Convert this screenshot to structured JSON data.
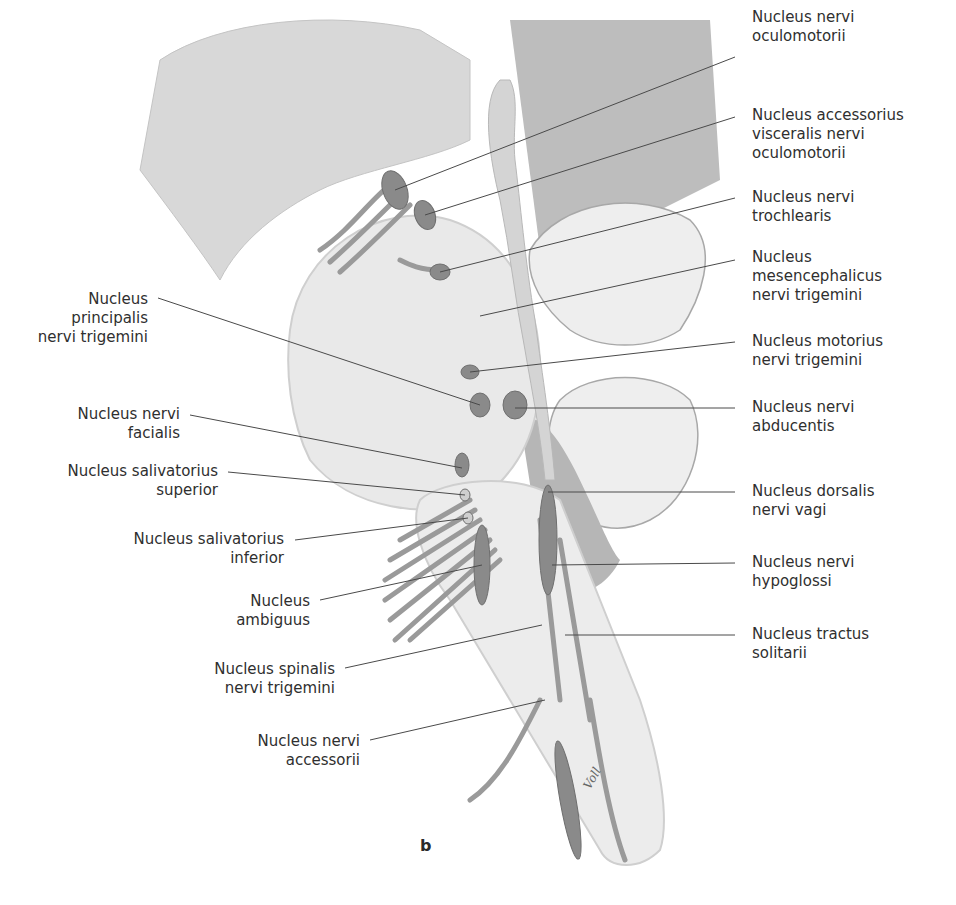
{
  "figure": {
    "panel_letter": "b",
    "signature": "Voll"
  },
  "labels_right": [
    {
      "text": "Nucleus nervi\noculomotorii"
    },
    {
      "text": "Nucleus accessorius\nvisceralis nervi\noculomotorii"
    },
    {
      "text": "Nucleus nervi\ntrochlearis"
    },
    {
      "text": "Nucleus\nmesencephalicus\nnervi trigemini"
    },
    {
      "text": "Nucleus motorius\nnervi trigemini"
    },
    {
      "text": "Nucleus nervi\nabducentis"
    },
    {
      "text": "Nucleus dorsalis\nnervi vagi"
    },
    {
      "text": "Nucleus nervi\nhypoglossi"
    },
    {
      "text": "Nucleus tractus\nsolitarii"
    }
  ],
  "labels_left": [
    {
      "text": "Nucleus\nprincipalis\nnervi trigemini"
    },
    {
      "text": "Nucleus nervi\nfacialis"
    },
    {
      "text": "Nucleus salivatorius\nsuperior"
    },
    {
      "text": "Nucleus salivatorius\ninferior"
    },
    {
      "text": "Nucleus\nambiguus"
    },
    {
      "text": "Nucleus spinalis\nnervi trigemini"
    },
    {
      "text": "Nucleus nervi\naccessorii"
    }
  ]
}
